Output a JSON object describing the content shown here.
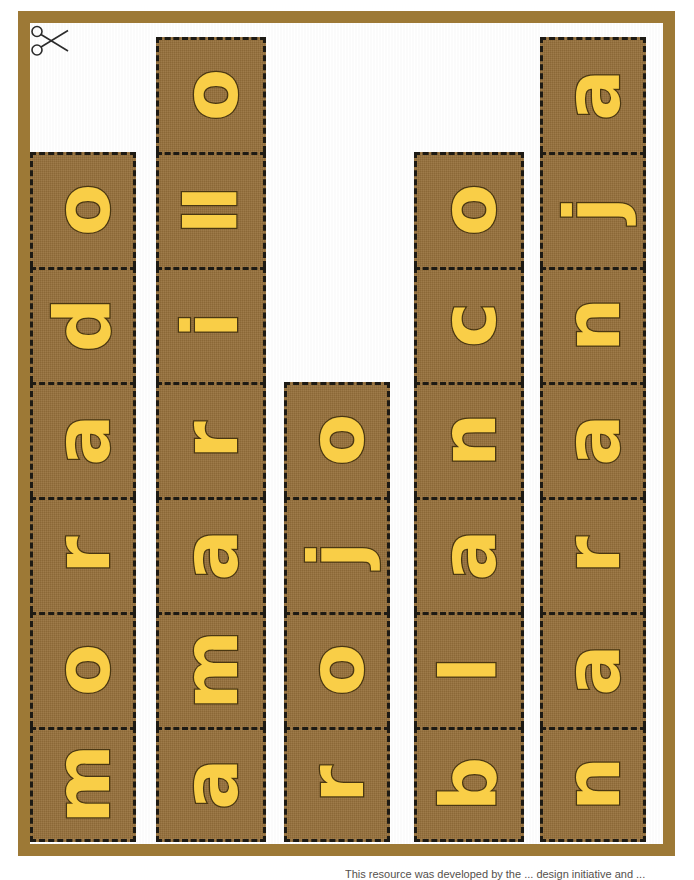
{
  "page": {
    "background_color": "#ffffff",
    "frame_color": "#9d7936",
    "tile_color": "#96703b",
    "letter_color": "#f9ce47",
    "letter_outline_color": "#4a3712",
    "cut_line_color": "#1d1a14"
  },
  "icons": {
    "scissors": "scissors-cut-icon"
  },
  "footer": {
    "caption": "This resource was developed by the ... design initiative and ..."
  },
  "strips": [
    {
      "word": "morado",
      "name": "strip-morado",
      "left": 30,
      "top": 152,
      "width": 106,
      "tile_height": 115,
      "tiles": [
        "o",
        "d",
        "a",
        "r",
        "o",
        "m"
      ]
    },
    {
      "word": "amarillo",
      "name": "strip-amarillo",
      "left": 156,
      "top": 37,
      "width": 110,
      "tile_height": 115,
      "tiles": [
        "o",
        "ll",
        "i",
        "r",
        "a",
        "m",
        "a"
      ]
    },
    {
      "word": "rojo",
      "name": "strip-rojo",
      "left": 284,
      "top": 382,
      "width": 106,
      "tile_height": 115,
      "tiles": [
        "o",
        "j",
        "o",
        "r"
      ]
    },
    {
      "word": "blanco",
      "name": "strip-blanco",
      "left": 414,
      "top": 152,
      "width": 110,
      "tile_height": 115,
      "tiles": [
        "o",
        "c",
        "n",
        "a",
        "l",
        "b"
      ]
    },
    {
      "word": "naranja",
      "name": "strip-naranja",
      "left": 540,
      "top": 37,
      "width": 106,
      "tile_height": 115,
      "tiles": [
        "a",
        "j",
        "n",
        "a",
        "r",
        "a",
        "n"
      ]
    }
  ]
}
